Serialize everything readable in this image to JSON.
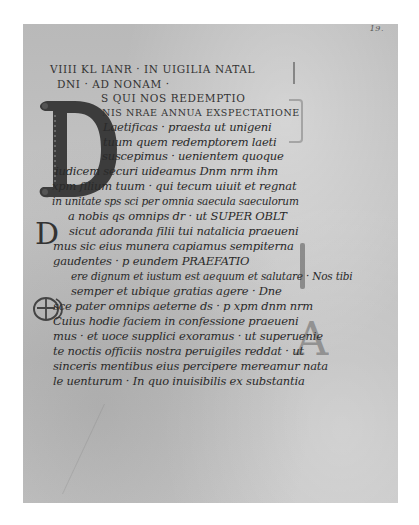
{
  "manuscript": {
    "folio_number": "19.",
    "initials": {
      "large": "D",
      "small": "D",
      "monogram": "TE",
      "margin_letter": "A"
    },
    "lines": [
      {
        "text": "VIIII KL IANR · IN UIGILIA NATAL",
        "style": "caps"
      },
      {
        "text": "DNI · AD NONAM ·",
        "style": "caps"
      },
      {
        "text": "S QUI NOS REDEMPTIO",
        "style": "caps"
      },
      {
        "text": "NIS NRAE ANNUA EXSPECTATIONE",
        "style": "caps"
      },
      {
        "text": "Laetificas · praesta ut unigeni",
        "style": "minuscule"
      },
      {
        "text": "tuum quem redemptorem laeti",
        "style": "minuscule"
      },
      {
        "text": "suscepimus · uenientem quoque",
        "style": "minuscule"
      },
      {
        "text": "iudicem securi uideamus   Dnm nrm ihm",
        "style": "minuscule"
      },
      {
        "text": "xpm filium tuum · qui tecum uiuit et regnat",
        "style": "minuscule"
      },
      {
        "text": "in unitate sps sci per omnia saecula saeculorum",
        "style": "minuscule"
      },
      {
        "text": "a nobis qs omnips dr · ut   SUPER OBLT",
        "style": "mixed"
      },
      {
        "text": "sicut adoranda filii tui natalicia praeueni",
        "style": "minuscule"
      },
      {
        "text": "mus sic eius munera capiamus sempiterna",
        "style": "minuscule"
      },
      {
        "text": "gaudentes · p eundem     PRAEFATIO",
        "style": "mixed"
      },
      {
        "text": "ere dignum et iustum est aequum et salutare · Nos tibi",
        "style": "minuscule"
      },
      {
        "text": "semper et ubique gratias agere · Dne",
        "style": "minuscule"
      },
      {
        "text": "sce pater omnips aeterne ds · p xpm dnm nrm",
        "style": "minuscule"
      },
      {
        "text": "Cuius hodie faciem in confessione praeueni",
        "style": "minuscule"
      },
      {
        "text": "mus · et uoce supplici exoramus · ut superuenie",
        "style": "minuscule"
      },
      {
        "text": "te noctis officiis nostra peruigiles reddat · ut",
        "style": "minuscule"
      },
      {
        "text": "sinceris mentibus eius percipere mereamur nata",
        "style": "minuscule"
      },
      {
        "text": "le uenturum · In quo inuisibilis ex substantia",
        "style": "minuscule"
      }
    ]
  }
}
